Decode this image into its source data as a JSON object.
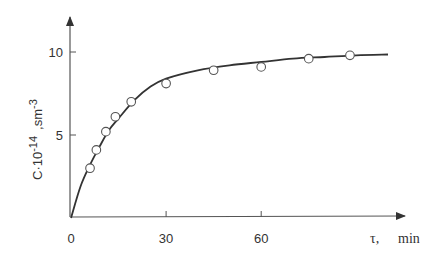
{
  "chart_data": {
    "type": "line",
    "title": "",
    "xlabel": "τ,   min",
    "ylabel": "C·10 -14 ,sm -3",
    "ylabel_parts": {
      "base": "C·10",
      "exp1": "-14",
      "unit": ",sm",
      "exp2": "-3"
    },
    "xlabel_parts": {
      "symbol": "τ,",
      "unit": "min"
    },
    "xlim": [
      0,
      105
    ],
    "ylim": [
      0,
      12
    ],
    "x_ticks": [
      0,
      30,
      60
    ],
    "x_tick_labels": [
      "0",
      "30",
      "60"
    ],
    "y_ticks": [
      5,
      10
    ],
    "y_tick_labels": [
      "5",
      "10"
    ],
    "grid": false,
    "legend": null,
    "series": [
      {
        "name": "experimental",
        "style": "open-circles",
        "x": [
          6,
          8,
          11,
          14,
          19,
          30,
          45,
          60,
          75,
          88
        ],
        "y": [
          3.0,
          4.1,
          5.2,
          6.1,
          7.0,
          8.1,
          8.9,
          9.1,
          9.6,
          9.8
        ]
      },
      {
        "name": "fit",
        "style": "solid-line",
        "x": [
          0,
          3,
          6,
          9,
          12,
          15,
          20,
          25,
          30,
          40,
          50,
          60,
          70,
          80,
          90,
          100
        ],
        "y": [
          0,
          1.9,
          3.2,
          4.3,
          5.3,
          6.0,
          7.1,
          7.9,
          8.4,
          8.9,
          9.2,
          9.4,
          9.6,
          9.7,
          9.8,
          9.85
        ]
      }
    ]
  }
}
